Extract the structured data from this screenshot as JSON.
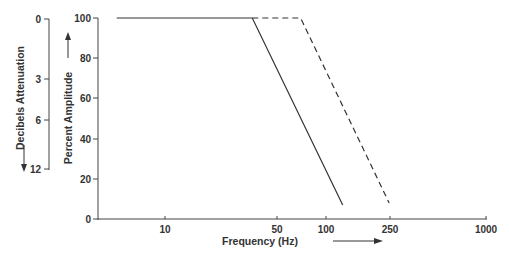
{
  "chart_data": {
    "type": "line",
    "title": "",
    "xlabel": "Frequency (Hz)",
    "ylabel": "Percent Amplitude",
    "secondary_ylabel": "Decibels Attenuation",
    "x_scale": "log",
    "xlim": [
      4,
      1000
    ],
    "ylim": [
      0,
      100
    ],
    "grid": false,
    "legend": null,
    "x_ticks": [
      10,
      50,
      100,
      250,
      1000
    ],
    "x_tick_labels": [
      "10",
      "50",
      "100",
      "250",
      "1000"
    ],
    "y_ticks": [
      0,
      20,
      40,
      60,
      80,
      100
    ],
    "y_tick_labels": [
      "0",
      "20",
      "40",
      "60",
      "80",
      "100"
    ],
    "secondary_y_tick_labels": [
      "0",
      "3",
      "6",
      "12"
    ],
    "secondary_y_tick_positions_percent": [
      100,
      70,
      50,
      25
    ],
    "series": [
      {
        "name": "solid",
        "style": "solid",
        "points": [
          [
            5,
            100
          ],
          [
            35,
            100
          ],
          [
            128,
            7
          ]
        ]
      },
      {
        "name": "dashed",
        "style": "dashed",
        "points": [
          [
            35,
            100
          ],
          [
            70,
            100
          ],
          [
            249,
            8
          ]
        ]
      }
    ]
  }
}
